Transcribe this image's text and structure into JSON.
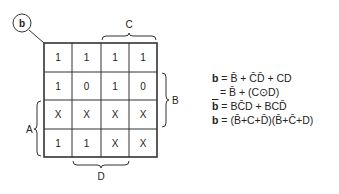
{
  "diagram": {
    "type": "karnaugh-map",
    "segment_label": "b",
    "grid": [
      [
        "1",
        "1",
        "1",
        "1"
      ],
      [
        "1",
        "0",
        "1",
        "0"
      ],
      [
        "X",
        "X",
        "X",
        "X"
      ],
      [
        "1",
        "1",
        "X",
        "X"
      ]
    ],
    "labels": {
      "top": "C",
      "right": "B",
      "left": "A",
      "bottom": "D"
    }
  },
  "equations": [
    {
      "lhs": "b",
      "lhs_bar": false,
      "rhs": "= B̄ + C̄D̄ + CD"
    },
    {
      "lhs": "",
      "lhs_bar": false,
      "rhs": "= B̄ + (C⊙D)"
    },
    {
      "lhs": "b",
      "lhs_bar": true,
      "rhs": "= BC̄D + BCD̄"
    },
    {
      "lhs": "b",
      "lhs_bar": false,
      "rhs": "= (B̄+C+D̄)(B̄+C̄+D)"
    }
  ]
}
